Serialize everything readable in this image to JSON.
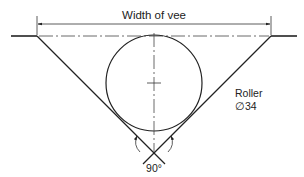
{
  "diagram": {
    "title": "Width of vee",
    "roller_label": "Roller",
    "roller_diameter": "∅34",
    "angle_label": "90°",
    "colors": {
      "line": "#222222",
      "background": "#ffffff"
    }
  }
}
